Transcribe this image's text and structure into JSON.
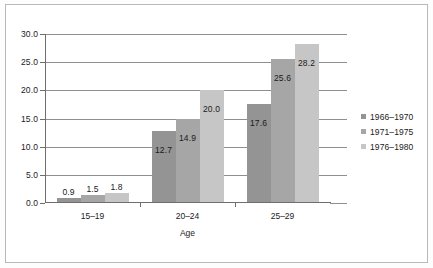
{
  "chart_data": {
    "type": "bar",
    "title": "",
    "xlabel": "Age",
    "ylabel": "",
    "categories": [
      "15–19",
      "20–24",
      "25–29"
    ],
    "series": [
      {
        "name": "1966–1970",
        "color": "#949494",
        "values": [
          0.9,
          12.7,
          17.6
        ]
      },
      {
        "name": "1971–1975",
        "color": "#a6a6a6",
        "values": [
          1.5,
          14.9,
          25.6
        ]
      },
      {
        "name": "1976–1980",
        "color": "#c6c6c6",
        "values": [
          1.8,
          20.0,
          28.2
        ]
      }
    ],
    "value_labels": [
      [
        "0.9",
        "12.7",
        "17.6"
      ],
      [
        "1.5",
        "14.9",
        "25.6"
      ],
      [
        "1.8",
        "20.0",
        "28.2"
      ]
    ],
    "ylim": [
      0.0,
      30.0
    ],
    "ytick_step": 5.0,
    "yticks": [
      "0.0",
      "5.0",
      "10.0",
      "15.0",
      "20.0",
      "25.0",
      "30.0"
    ],
    "ytick_values": [
      0.0,
      5.0,
      10.0,
      15.0,
      20.0,
      25.0,
      30.0
    ],
    "grid": "horizontal",
    "legend_position": "right"
  }
}
